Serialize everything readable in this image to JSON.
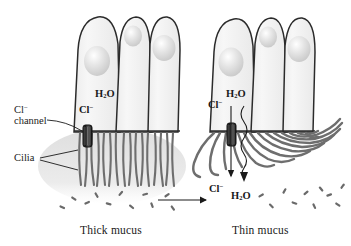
{
  "figure": {
    "title_visible": false,
    "panels": [
      {
        "id": "left",
        "caption": "Thick mucus",
        "labels": {
          "cl_channel_line1": "Cl",
          "cl_channel_line1_charge": "−",
          "cl_channel_line2": "channel",
          "cilia": "Cilia",
          "water": "H",
          "water_sub": "2",
          "water_tail": "O",
          "chloride": "Cl",
          "chloride_charge": "−"
        }
      },
      {
        "id": "right",
        "caption": "Thin mucus",
        "labels": {
          "water_top": "H",
          "water_top_sub": "2",
          "water_top_tail": "O",
          "chloride_top": "Cl",
          "chloride_top_charge": "−",
          "chloride_bottom": "Cl",
          "chloride_bottom_charge": "−",
          "water_bottom": "H",
          "water_bottom_sub": "2",
          "water_bottom_tail": "O"
        }
      }
    ],
    "transition_arrow": {
      "direction": "right",
      "label": ""
    }
  },
  "colors": {
    "cell_fill": "#f4f4f4",
    "cell_outline": "#2b2b2b",
    "nucleus": "#dcdcdc",
    "cilia": "#6e6e6e",
    "mucus_thick": "#e4e4e4",
    "particle": "#6a6a6a",
    "channel_dark": "#1e1e1e",
    "text": "#1a1a1a"
  },
  "counts": {
    "cells_per_panel": 3,
    "nuclei_per_panel": 3,
    "channels_per_panel": 1
  }
}
